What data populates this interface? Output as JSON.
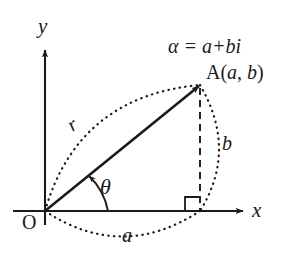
{
  "figure": {
    "background_color": "#ffffff",
    "stroke_color": "#1a1a1a"
  },
  "axes": {
    "y_label": "y",
    "x_label": "x",
    "origin_label": "O",
    "origin_px": [
      45,
      211
    ],
    "x_axis_y_px": 211,
    "y_axis_x_px": 45
  },
  "point": {
    "name": "A",
    "label": "A(a, b)",
    "label_prefix": "A(",
    "label_real": "a",
    "label_sep": ", ",
    "label_imag": "b",
    "label_suffix": ")",
    "coords_px": [
      200,
      85
    ]
  },
  "equation": {
    "text": "α = a+bi",
    "alpha": "α",
    "equals": "=",
    "real_part": "a",
    "plus": "+",
    "imag_part": "bi"
  },
  "annotations": {
    "modulus_label": "r",
    "argument_label": "θ",
    "real_component_label": "a",
    "imaginary_component_label": "b"
  },
  "elements": {
    "vector_arrow": "vector from origin to A",
    "dashed_drop_line": "dashed vertical from A to x-axis",
    "right_angle_marker": "square at foot of perpendicular",
    "modulus_arc": "dotted arc labelled r",
    "real_arc": "dotted arc labelled a below x-axis",
    "imaginary_arc": "dotted arc labelled b right of drop line",
    "angle_arc": "curved arrow labelled theta"
  }
}
